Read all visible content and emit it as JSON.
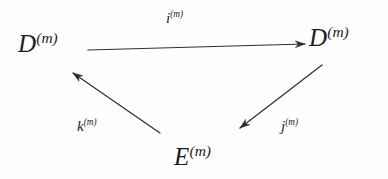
{
  "diagram": {
    "type": "commutative-triangle",
    "background_color": "#fefefe",
    "ink_color": "#1c1c1c",
    "nodes": [
      {
        "id": "d-left",
        "base": "D",
        "superscript": "(m)",
        "x": 48,
        "y": 45
      },
      {
        "id": "d-right",
        "base": "D",
        "superscript": "(m)",
        "x": 338,
        "y": 39
      },
      {
        "id": "e-bottom",
        "base": "E",
        "superscript": "(m)",
        "x": 200,
        "y": 158
      }
    ],
    "edges": [
      {
        "id": "i",
        "base": "i",
        "superscript": "(m)",
        "from": "d-left",
        "to": "d-right",
        "x1": 88,
        "y1": 50,
        "x2": 305,
        "y2": 44,
        "label_position": "above-center"
      },
      {
        "id": "j",
        "base": "j",
        "superscript": "(m)",
        "from": "d-right",
        "to": "e-bottom",
        "x1": 322,
        "y1": 65,
        "x2": 240,
        "y2": 128,
        "label_position": "right"
      },
      {
        "id": "k",
        "base": "k",
        "superscript": "(m)",
        "from": "e-bottom",
        "to": "d-left",
        "x1": 160,
        "y1": 133,
        "x2": 73,
        "y2": 73,
        "label_position": "below-left"
      }
    ]
  }
}
